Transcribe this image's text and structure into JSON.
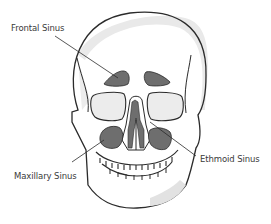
{
  "diagram": {
    "colors": {
      "outline": "#2b2b2b",
      "sinus_fill": "#6e6e6e",
      "bone_shade": "#e4e4e4",
      "background": "#ffffff",
      "label_text": "#3a3a3a"
    },
    "labels": [
      {
        "id": "frontal",
        "text": "Frontal Sinus",
        "x": 11,
        "y": 23
      },
      {
        "id": "maxillary",
        "text": "Maxillary Sinus",
        "x": 14,
        "y": 171
      },
      {
        "id": "ethmoid",
        "text": "Ethmoid Sinus",
        "x": 200,
        "y": 154
      }
    ]
  }
}
